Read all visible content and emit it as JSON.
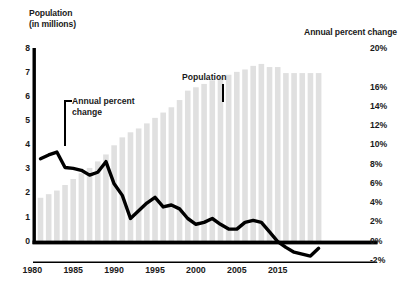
{
  "titles": {
    "left_line1": "Population",
    "left_line2": "(in millions)",
    "right": "Annual percent change"
  },
  "annotations": {
    "population": "Population",
    "apc_line1": "Annual percent",
    "apc_line2": "change"
  },
  "colors": {
    "bar": "#e0e0e0",
    "line": "#000000",
    "axis": "#000000",
    "text": "#1a1a1a",
    "background": "#ffffff"
  },
  "chart_data": {
    "type": "bar",
    "xlabel": "",
    "ylabel": "Population (in millions)",
    "y2label": "Annual percent change",
    "ylim": [
      0,
      8
    ],
    "y2lim": [
      -2,
      20
    ],
    "grid": false,
    "legend": "annotations",
    "xticks": [
      "1980",
      "1985",
      "1990",
      "1995",
      "2000",
      "2005",
      "2015"
    ],
    "xtick_years": [
      1980,
      1985,
      1990,
      1995,
      2000,
      2005,
      2010
    ],
    "yticks_left": [
      "8",
      "7",
      "6",
      "5",
      "4",
      "3",
      "2",
      "1",
      "0"
    ],
    "yticks_right": [
      "20%",
      "16%",
      "14%",
      "12%",
      "10%",
      "8%",
      "6%",
      "4%",
      "2%",
      "0%",
      "-2%"
    ],
    "yticks_right_values": [
      20,
      16,
      14,
      12,
      10,
      8,
      6,
      4,
      2,
      0,
      -2
    ],
    "x": [
      1981,
      1982,
      1983,
      1984,
      1985,
      1986,
      1987,
      1988,
      1989,
      1990,
      1991,
      1992,
      1993,
      1994,
      1995,
      1996,
      1997,
      1998,
      1999,
      2000,
      2001,
      2002,
      2003,
      2004,
      2005,
      2006,
      2007,
      2008,
      2009,
      2010,
      2011,
      2012,
      2013,
      2014,
      2015
    ],
    "series": [
      {
        "name": "Population",
        "type": "bar",
        "axis": "left",
        "unit": "millions",
        "values": [
          1.82,
          1.97,
          2.12,
          2.35,
          2.6,
          2.84,
          3.06,
          3.33,
          3.62,
          4.0,
          4.33,
          4.54,
          4.7,
          4.91,
          5.14,
          5.36,
          5.58,
          5.88,
          6.27,
          6.41,
          6.55,
          6.7,
          6.82,
          6.93,
          7.05,
          7.15,
          7.3,
          7.38,
          7.25,
          7.25,
          7.0,
          7.0,
          7.0,
          7.0,
          7.0
        ]
      },
      {
        "name": "Annual percent change",
        "type": "line",
        "axis": "right",
        "unit": "percent",
        "values": [
          8.6,
          9.0,
          9.3,
          7.7,
          7.6,
          7.4,
          6.9,
          7.2,
          8.3,
          6.0,
          4.8,
          2.4,
          3.2,
          4.0,
          4.6,
          3.6,
          3.8,
          3.4,
          2.4,
          1.8,
          2.0,
          2.4,
          1.8,
          1.3,
          1.3,
          2.0,
          2.2,
          2.0,
          1.0,
          0.0,
          -0.6,
          -1.1,
          -1.3,
          -1.5,
          -0.7
        ]
      }
    ]
  }
}
